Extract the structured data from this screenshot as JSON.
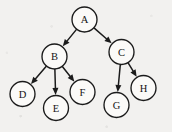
{
  "diagram": {
    "type": "directed-tree",
    "title": "",
    "canvas": {
      "width": 172,
      "height": 132
    },
    "background_color": "#f2f1ef",
    "stroke_color": "#1b1b1b",
    "node_fill_color": "#fbfaf8",
    "node_radius": 12.5,
    "nodes": [
      {
        "id": "A",
        "label": "A",
        "cx": 84.5,
        "cy": 19.5,
        "level": 0
      },
      {
        "id": "B",
        "label": "B",
        "cx": 54.5,
        "cy": 56.5,
        "level": 1
      },
      {
        "id": "C",
        "label": "C",
        "cx": 121.5,
        "cy": 52.0,
        "level": 1
      },
      {
        "id": "D",
        "label": "D",
        "cx": 22.5,
        "cy": 94.0,
        "level": 2
      },
      {
        "id": "E",
        "label": "E",
        "cx": 56.0,
        "cy": 108.0,
        "level": 2
      },
      {
        "id": "F",
        "label": "F",
        "cx": 82.5,
        "cy": 92.0,
        "level": 2
      },
      {
        "id": "G",
        "label": "G",
        "cx": 116.5,
        "cy": 105.0,
        "level": 2
      },
      {
        "id": "H",
        "label": "H",
        "cx": 143.5,
        "cy": 88.0,
        "level": 2
      }
    ],
    "edges": [
      {
        "from": "A",
        "to": "B",
        "directed": true
      },
      {
        "from": "A",
        "to": "C",
        "directed": true
      },
      {
        "from": "B",
        "to": "D",
        "directed": true
      },
      {
        "from": "B",
        "to": "E",
        "directed": true
      },
      {
        "from": "B",
        "to": "F",
        "directed": true
      },
      {
        "from": "C",
        "to": "G",
        "directed": true
      },
      {
        "from": "C",
        "to": "H",
        "directed": true
      }
    ]
  }
}
